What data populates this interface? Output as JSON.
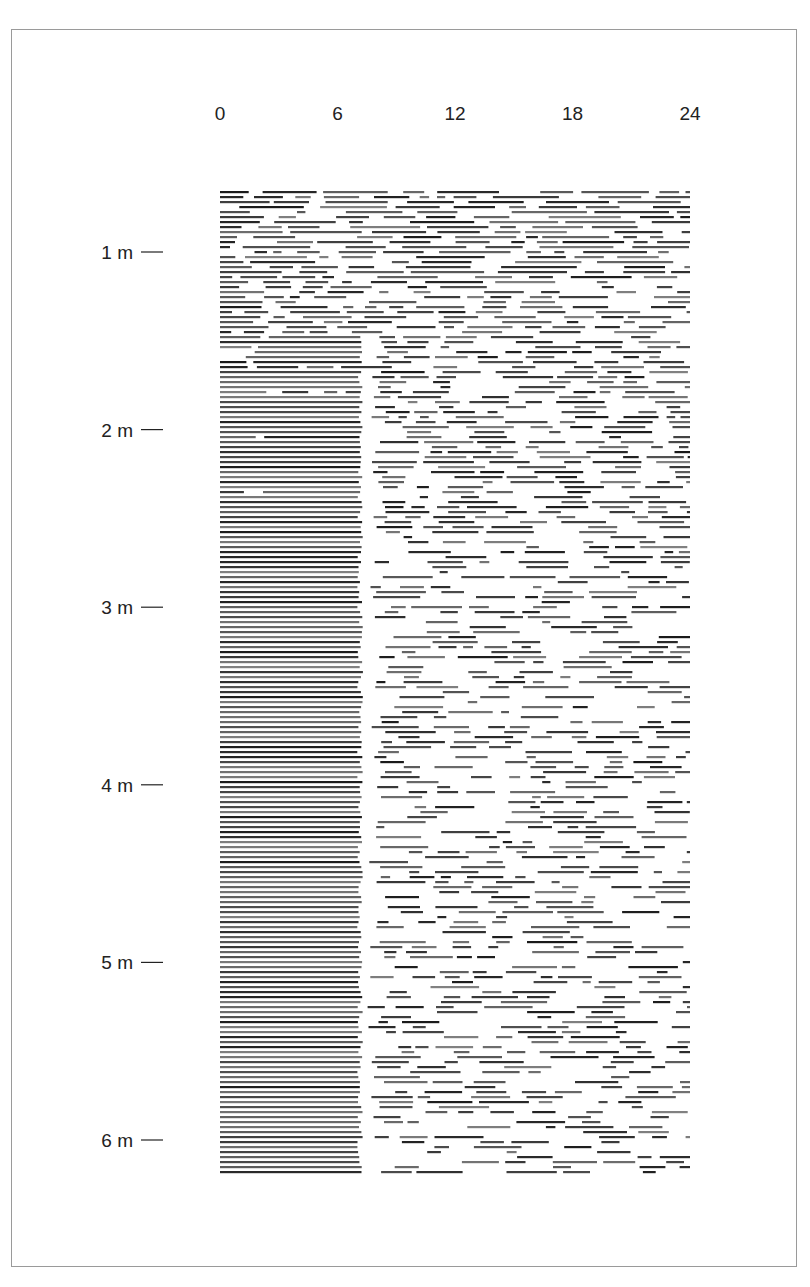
{
  "chart_data": {
    "type": "heatmap",
    "title": "",
    "xlabel": "",
    "ylabel": "",
    "x_ticks": [
      "0",
      "6",
      "12",
      "18",
      "24"
    ],
    "x_tick_values": [
      0,
      6,
      12,
      18,
      24
    ],
    "xlim": [
      0,
      24
    ],
    "y_ticks": [
      "1 m",
      "2 m",
      "3 m",
      "4 m",
      "5 m",
      "6 m"
    ],
    "y_tick_values": [
      1,
      2,
      3,
      4,
      5,
      6
    ],
    "ylim": [
      0,
      6.5
    ],
    "grid": false,
    "legend": "none",
    "bar_color": "#1a1a1a",
    "phases": [
      {
        "from_month": 0.0,
        "to_month": 1.0,
        "pattern": "fragmented sleep spread across all 24 hours"
      },
      {
        "from_month": 1.0,
        "to_month": 2.5,
        "pattern": "consolidation of sleep in hours 0-7, remaining hours fragmented"
      },
      {
        "from_month": 2.5,
        "to_month": 6.5,
        "pattern": "consolidated night sleep 0-7 h, sparse daytime naps 7-24 h"
      }
    ]
  }
}
